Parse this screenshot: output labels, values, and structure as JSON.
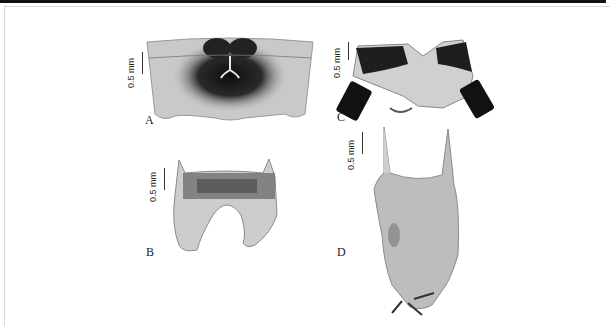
{
  "figure": {
    "panels": [
      {
        "id": "A",
        "label": "A",
        "scale_label": "0.5 mm"
      },
      {
        "id": "B",
        "label": "B",
        "scale_label": "0.5 mm"
      },
      {
        "id": "C",
        "label": "C",
        "scale_label": "0.5 mm"
      },
      {
        "id": "D",
        "label": "D",
        "scale_label": "0.5 mm"
      }
    ]
  }
}
